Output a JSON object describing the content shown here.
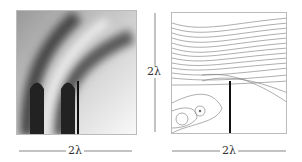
{
  "figure": {
    "left_panel": {
      "description": "intensity field near a screen edge",
      "scale_label": "2λ"
    },
    "right_panel": {
      "description": "energy flow lines near a screen edge",
      "scale_label_x": "2λ",
      "scale_label_y": "2λ"
    }
  }
}
